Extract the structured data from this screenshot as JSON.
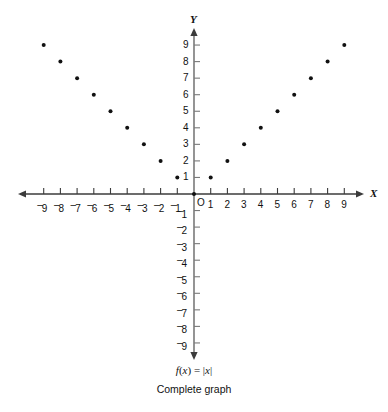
{
  "figure": {
    "formula_parts": {
      "f": "f",
      "paren_open": "(",
      "x1": "x",
      "paren_close": ")",
      "equals": " = ",
      "bar_open": "|",
      "x2": "x",
      "bar_close": "|"
    },
    "caption": "Complete graph",
    "background_color": "#ffffff",
    "ink_color": "#111111"
  },
  "chart_data": {
    "type": "scatter",
    "title": "",
    "subtitle": "Complete graph",
    "annotations": [
      "f(x) = |x|"
    ],
    "xlabel": "X",
    "ylabel": "Y",
    "xlim": [
      -10,
      10
    ],
    "ylim": [
      -10,
      10
    ],
    "grid": false,
    "legend": "none",
    "origin_label": "O",
    "x_tick_values": [
      -9,
      -8,
      -7,
      -6,
      -5,
      -4,
      -3,
      -2,
      -1,
      1,
      2,
      3,
      4,
      5,
      6,
      7,
      8,
      9
    ],
    "x_tick_labels": [
      "⁻9",
      "⁻8",
      "⁻7",
      "⁻6",
      "⁻5",
      "⁻4",
      "⁻3",
      "⁻2",
      "⁻1",
      "1",
      "2",
      "3",
      "4",
      "5",
      "6",
      "7",
      "8",
      "9"
    ],
    "y_tick_values": [
      9,
      8,
      7,
      6,
      5,
      4,
      3,
      2,
      1,
      -1,
      -2,
      -3,
      -4,
      -5,
      -6,
      -7,
      -8,
      -9
    ],
    "y_tick_labels": [
      "9",
      "8",
      "7",
      "6",
      "5",
      "4",
      "3",
      "2",
      "1",
      "⁻1",
      "⁻2",
      "⁻3",
      "⁻4",
      "⁻5",
      "⁻6",
      "⁻7",
      "⁻8",
      "⁻9"
    ],
    "x": [
      -9,
      -8,
      -7,
      -6,
      -5,
      -4,
      -3,
      -2,
      -1,
      0,
      1,
      2,
      3,
      4,
      5,
      6,
      7,
      8,
      9
    ],
    "y": [
      9,
      8,
      7,
      6,
      5,
      4,
      3,
      2,
      1,
      0,
      1,
      2,
      3,
      4,
      5,
      6,
      7,
      8,
      9
    ],
    "marker": "filled-circle",
    "marker_color": "#111111",
    "marker_size_px": 4
  }
}
